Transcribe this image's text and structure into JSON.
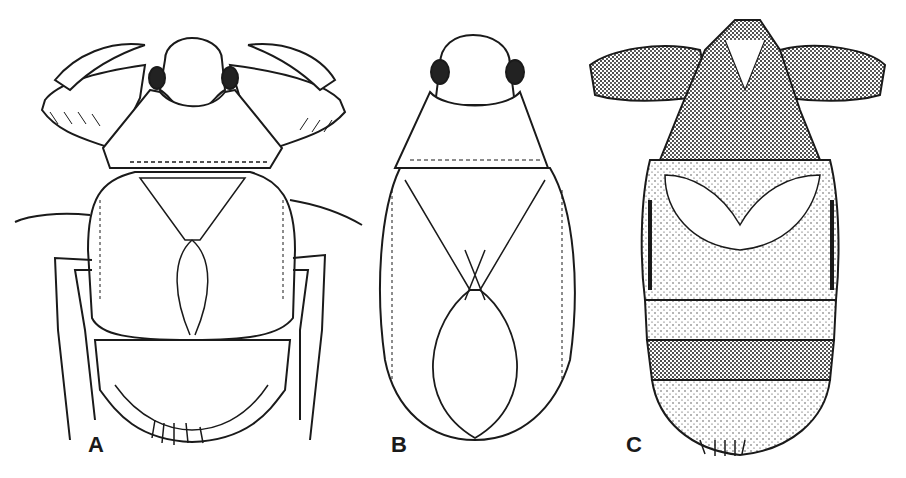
{
  "figure": {
    "panels": [
      {
        "id": "A",
        "label": "A",
        "subject": "insect with raptorial forelegs, pronotum, hemelytra and abdomen"
      },
      {
        "id": "B",
        "label": "B",
        "subject": "elongate oval insect, dorsal view with overlapping hemelytra"
      },
      {
        "id": "C",
        "label": "C",
        "subject": "stippled/shaded nymph-like insect with raptorial forelegs and segmented abdomen"
      }
    ],
    "colors": {
      "ink": "#1a1a1a",
      "background": "#ffffff",
      "eye": "#222222"
    }
  }
}
